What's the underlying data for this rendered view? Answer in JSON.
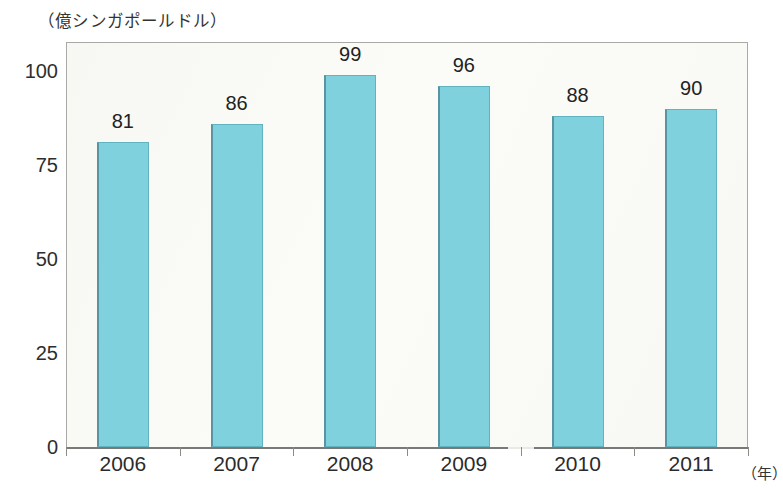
{
  "chart_data": {
    "type": "bar",
    "title": "",
    "subtitle": "",
    "xlabel": "（年）",
    "ylabel": "（億シンガポールドル）",
    "categories": [
      "2006",
      "2007",
      "2008",
      "2009",
      "2010",
      "2011"
    ],
    "values": [
      81,
      86,
      99,
      96,
      88,
      90
    ],
    "series": [
      {
        "name": "",
        "values": [
          81,
          86,
          99,
          96,
          88,
          90
        ]
      }
    ],
    "ylim": [
      0,
      106
    ],
    "yticks": [
      0,
      25,
      50,
      75,
      100
    ],
    "ytick_labels": [
      "0",
      "25",
      "50",
      "75",
      "100"
    ],
    "grid": false,
    "legend": false,
    "legend_position": "none",
    "data_labels": [
      "81",
      "86",
      "99",
      "96",
      "88",
      "90"
    ],
    "bar_color": "#7fd2dd",
    "bar_edge_color": "#62b3c0",
    "axis_color": "#787a77",
    "plot_background": "#fbfbf7",
    "annotations": []
  },
  "axes": {
    "y_unit_caption": "（億シンガポールドル）",
    "x_unit_caption": "（年）"
  }
}
